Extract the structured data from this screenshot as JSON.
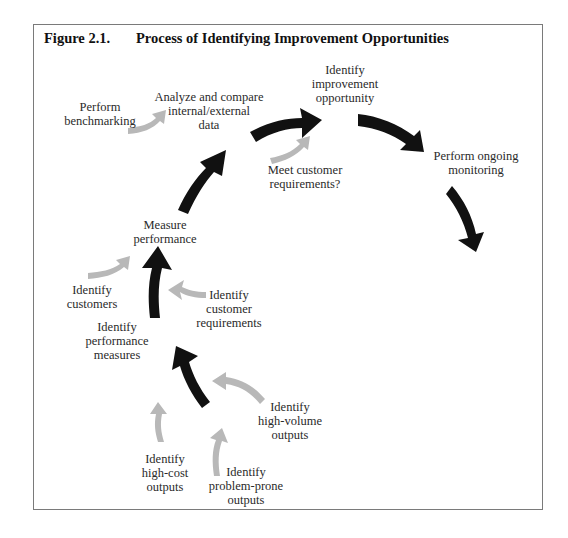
{
  "figure": {
    "number": "Figure 2.1.",
    "title": "Process of Identifying Improvement Opportunities"
  },
  "colors": {
    "main_arrow": "#111111",
    "input_arrow": "#b8b8b8",
    "border": "#7a7a7a"
  },
  "nodes": {
    "identify_high_cost_outputs": "Identify\nhigh-cost\noutputs",
    "identify_problem_prone_outputs": "Identify\nproblem-prone\noutputs",
    "identify_high_volume_outputs": "Identify\nhigh-volume\noutputs",
    "identify_performance_measures": "Identify\nperformance\nmeasures",
    "identify_customers": "Identify\ncustomers",
    "identify_customer_requirements": "Identify\ncustomer\nrequirements",
    "measure_performance": "Measure\nperformance",
    "perform_benchmarking": "Perform\nbenchmarking",
    "analyze_compare_data": "Analyze and compare\ninternal/external\ndata",
    "meet_customer_requirements": "Meet customer\nrequirements?",
    "identify_improvement_opportunity": "Identify\nimprovement\nopportunity",
    "perform_ongoing_monitoring": "Perform ongoing\nmonitoring"
  },
  "flow": {
    "main_sequence": [
      "Identify performance measures",
      "Measure performance",
      "Analyze and compare internal/external data",
      "Identify improvement opportunity",
      "Perform ongoing monitoring"
    ],
    "inputs": {
      "Identify performance measures": [
        "Identify high-cost outputs",
        "Identify problem-prone outputs",
        "Identify high-volume outputs"
      ],
      "Measure performance": [
        "Identify customers",
        "Identify customer requirements"
      ],
      "Analyze and compare internal/external data": [
        "Perform benchmarking"
      ],
      "Identify improvement opportunity": [
        "Meet customer requirements?"
      ]
    }
  }
}
